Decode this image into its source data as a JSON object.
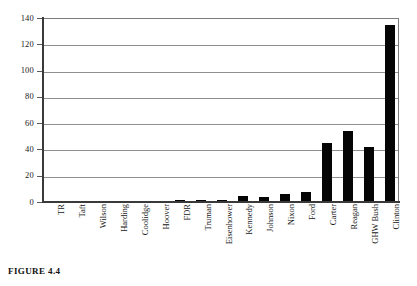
{
  "caption": "FIGURE 4.4",
  "chart_data": {
    "type": "bar",
    "title": "",
    "xlabel": "",
    "ylabel": "",
    "ylim": [
      0,
      140
    ],
    "yticks": [
      0,
      20,
      40,
      60,
      80,
      100,
      120,
      140
    ],
    "ytick_labels": [
      "0",
      "20",
      "40",
      "60",
      "80",
      "100",
      "120",
      "140"
    ],
    "grid": true,
    "legend": "none",
    "bar_color": "#050505",
    "grid_color": "#8f8f8f",
    "axis_color": "#3a3a3a",
    "categories": [
      "TR",
      "Taft",
      "Wilson",
      "Harding",
      "Coolidge",
      "Hoover",
      "FDR",
      "Truman",
      "Eisenhower",
      "Kennedy",
      "Johnson",
      "Nixon",
      "Ford",
      "Carter",
      "Reagan",
      "GHW Bush",
      "Clinton"
    ],
    "values": [
      0,
      0,
      0,
      0,
      0,
      0,
      1,
      1,
      1,
      4,
      3,
      5,
      7,
      44,
      53,
      41,
      134
    ]
  }
}
